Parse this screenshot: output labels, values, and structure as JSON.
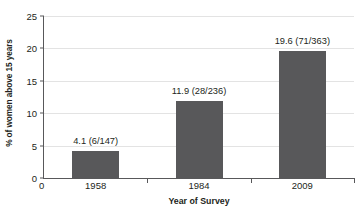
{
  "chart_data": {
    "type": "bar",
    "title": "",
    "xlabel": "Year of Survey",
    "ylabel": "% of women above 15 years",
    "categories": [
      "1958",
      "1984",
      "2009"
    ],
    "values": [
      4.1,
      11.9,
      19.6
    ],
    "point_labels": [
      "4.1 (6/147)",
      "11.9 (28/236)",
      "19.6 (71/363)"
    ],
    "numerators": [
      6,
      28,
      71
    ],
    "denominators": [
      147,
      236,
      363
    ],
    "ylim": [
      0,
      25
    ],
    "ytick_labels": [
      "0",
      "5",
      "10",
      "15",
      "20",
      "25"
    ],
    "ytick_values": [
      0,
      5,
      10,
      15,
      20,
      25
    ],
    "x_origin_label": "0",
    "grid": true,
    "legend": "none",
    "bar_color": "#58585a",
    "gridline_color": "#e3e3e3",
    "axis_color": "#58585a",
    "text_color": "#231f20",
    "background_color": "#ffffff"
  }
}
